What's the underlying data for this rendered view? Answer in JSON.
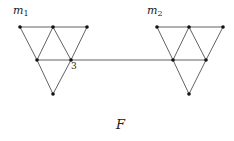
{
  "figure": {
    "caption": "F",
    "graphs": [
      {
        "name": "m1",
        "label_main": "m",
        "label_sub": "1",
        "label_pos": [
          13,
          14
        ],
        "nodes": [
          [
            20,
            27
          ],
          [
            53,
            27
          ],
          [
            87,
            27
          ],
          [
            37,
            60
          ],
          [
            71,
            60
          ],
          [
            53,
            94
          ]
        ],
        "edges": [
          [
            0,
            1
          ],
          [
            1,
            2
          ],
          [
            0,
            3
          ],
          [
            1,
            3
          ],
          [
            1,
            4
          ],
          [
            2,
            4
          ],
          [
            3,
            4
          ],
          [
            3,
            5
          ],
          [
            4,
            5
          ]
        ]
      },
      {
        "name": "m2",
        "label_main": "m",
        "label_sub": "2",
        "label_pos": [
          147,
          14
        ],
        "nodes": [
          [
            157,
            27
          ],
          [
            189,
            27
          ],
          [
            223,
            27
          ],
          [
            173,
            60
          ],
          [
            206,
            60
          ],
          [
            189,
            94
          ]
        ],
        "edges": [
          [
            0,
            1
          ],
          [
            1,
            2
          ],
          [
            0,
            3
          ],
          [
            1,
            3
          ],
          [
            1,
            4
          ],
          [
            2,
            4
          ],
          [
            3,
            4
          ],
          [
            3,
            5
          ],
          [
            4,
            5
          ]
        ]
      }
    ],
    "bridge": {
      "from": [
        71,
        60
      ],
      "to": [
        173,
        60
      ]
    },
    "vertex_label": {
      "text": "3",
      "pos": [
        71,
        69
      ]
    },
    "caption_pos": [
      116,
      129
    ]
  }
}
